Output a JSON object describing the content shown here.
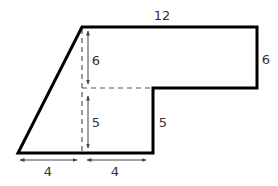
{
  "diagram": {
    "type": "composite-geometric-figure",
    "colors": {
      "outline": "#000000",
      "dashed": "#555555",
      "arrow": "#444444",
      "label": "#333333"
    },
    "labels": {
      "top_width": "12",
      "right_height": "6",
      "upper_inner_height": "6",
      "lower_inner_height": "5",
      "step_height": "5",
      "bottom_left_width": "4",
      "bottom_right_width": "4"
    }
  }
}
